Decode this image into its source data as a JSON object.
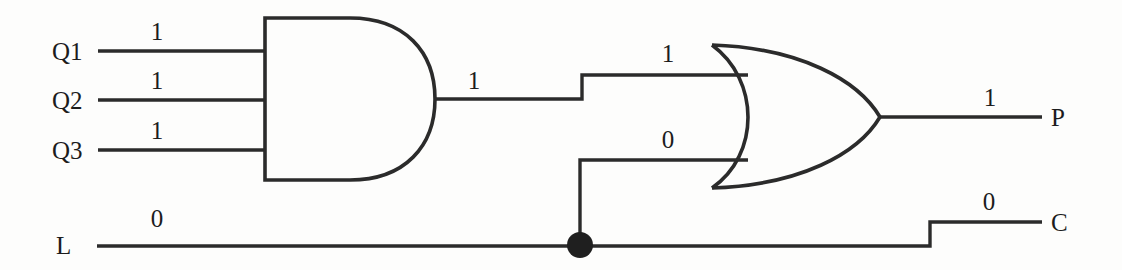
{
  "diagram": {
    "background_color": "#fdfdfc",
    "line_color": "#2b2b2b",
    "text_color": "#1c1c1c"
  },
  "inputs": [
    {
      "name": "Q1",
      "label": "Q1",
      "value": "1"
    },
    {
      "name": "Q2",
      "label": "Q2",
      "value": "1"
    },
    {
      "name": "Q3",
      "label": "Q3",
      "value": "1"
    },
    {
      "name": "L",
      "label": "L",
      "value": "0"
    }
  ],
  "gates": {
    "and": {
      "type": "AND",
      "output_value": "1"
    },
    "or": {
      "type": "OR",
      "top_input_value": "1",
      "bottom_input_value": "0",
      "output_value": "1"
    }
  },
  "outputs": [
    {
      "name": "P",
      "label": "P",
      "value": "1"
    },
    {
      "name": "C",
      "label": "C",
      "value": "0"
    }
  ],
  "junction": {
    "name": "L-branch-junction",
    "label": ""
  }
}
